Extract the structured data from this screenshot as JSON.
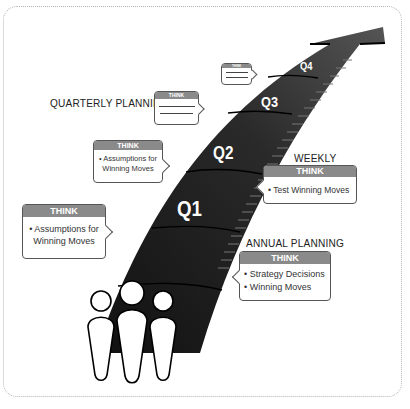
{
  "diagram": {
    "labels": {
      "quarterly_planning": "QUARTERLY PLANNING",
      "weekly": "WEEKLY",
      "annual_planning": "ANNUAL PLANNING"
    },
    "quarters": [
      "Q1",
      "Q2",
      "Q3",
      "Q4"
    ],
    "bubbles": {
      "left_large": {
        "header": "THINK",
        "lines": [
          "• Assumptions for",
          "Winning Moves"
        ]
      },
      "left_mid": {
        "header": "THINK",
        "lines": [
          "• Assumptions for",
          "Winning Moves"
        ]
      },
      "quarterly": {
        "header": "THINK",
        "lines": []
      },
      "top_small": {
        "header": "THINK",
        "lines": []
      },
      "weekly": {
        "header": "THINK",
        "lines": [
          "• Test Winning Moves"
        ]
      },
      "annual": {
        "header": "THINK",
        "lines": [
          "• Strategy Decisions",
          "• Winning Moves"
        ]
      }
    },
    "colors": {
      "arrow": "#222222",
      "bubble_header": "#8a8a8a",
      "bubble_border": "#555555",
      "frame_dots": "#b5b5b5"
    },
    "icons": [
      "people-group-icon",
      "arrow-up-right-icon"
    ]
  }
}
